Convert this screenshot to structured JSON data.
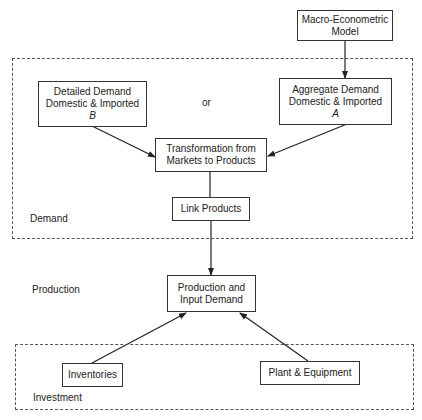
{
  "diagram": {
    "nodes": {
      "macro": {
        "line1": "Macro-Econometric",
        "line2": "Model"
      },
      "detailed": {
        "line1": "Detailed Demand",
        "line2": "Domestic & Imported",
        "line3": "B"
      },
      "aggregate": {
        "line1": "Aggregate Demand",
        "line2": "Domestic & Imported",
        "line3": "A"
      },
      "transformation": {
        "line1": "Transformation from",
        "line2": "Markets to Products"
      },
      "link": {
        "line1": "Link Products"
      },
      "production": {
        "line1": "Production and",
        "line2": "Input Demand"
      },
      "inventories": {
        "line1": "Inventories"
      },
      "plant": {
        "line1": "Plant & Equipment"
      }
    },
    "connector_label": "or",
    "groups": {
      "demand": "Demand",
      "production": "Production",
      "investment": "Investment"
    },
    "edges": [
      {
        "from": "macro",
        "to": "aggregate"
      },
      {
        "from": "detailed",
        "to": "transformation"
      },
      {
        "from": "aggregate",
        "to": "transformation"
      },
      {
        "from": "transformation",
        "to": "link"
      },
      {
        "from": "link",
        "to": "production"
      },
      {
        "from": "inventories",
        "to": "production"
      },
      {
        "from": "plant",
        "to": "production"
      }
    ]
  }
}
